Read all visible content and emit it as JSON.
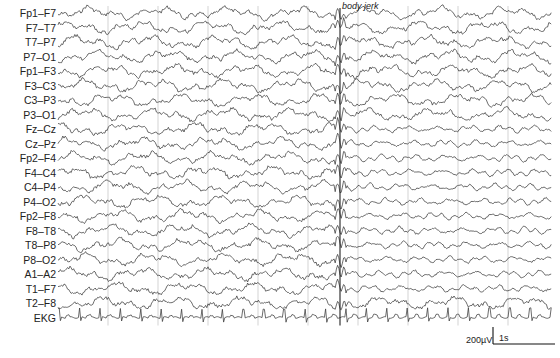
{
  "chart_data": {
    "type": "line",
    "title": "",
    "xlabel": "",
    "ylabel": "",
    "grid": "vertical lines every 1 s",
    "channels": [
      "Fp1–F7",
      "F7–T7",
      "T7–P7",
      "P7–O1",
      "Fp1–F3",
      "F3–C3",
      "C3–P3",
      "P3–O1",
      "Fz–Cz",
      "Cz–Pz",
      "Fp2–F4",
      "F4–C4",
      "C4–P4",
      "P4–O2",
      "Fp2–F8",
      "F8–T8",
      "T8–P8",
      "P8–O2",
      "A1–A2",
      "T1–F7",
      "T2–F8",
      "EKG"
    ],
    "duration_s": 9.5,
    "annotations": [
      {
        "text": "body jerk",
        "time_s": 4.6
      }
    ],
    "scale_bar": {
      "amplitude": "200µV",
      "time": "1s"
    }
  },
  "plot": {
    "x_start": 58,
    "x_end": 552,
    "y_first": 13,
    "row_spacing": 14.5,
    "gridlines_x": [
      108,
      158,
      208,
      258,
      308,
      358,
      408,
      458,
      508
    ],
    "marker_x": 340,
    "trace_color": "#3a3a3a",
    "grid_color": "#c8c8c8"
  },
  "annotation_label": "body jerk",
  "scale": {
    "amp_label": "200µV",
    "time_label": "1s"
  }
}
